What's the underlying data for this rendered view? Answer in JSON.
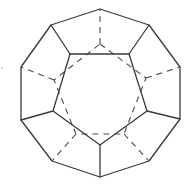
{
  "figure": {
    "view": "face-on along five-fold axis",
    "colors": {
      "line": "#3a3a3a",
      "hidden_line": "#4a4a4a",
      "background": "#ffffff"
    },
    "outer_decagon": [
      [
        100,
        9
      ],
      [
        149,
        25
      ],
      [
        180,
        67
      ],
      [
        180,
        119
      ],
      [
        149,
        161
      ],
      [
        100,
        177
      ],
      [
        52,
        161
      ],
      [
        21,
        120
      ],
      [
        21,
        67
      ],
      [
        51,
        25
      ]
    ],
    "front_pentagon": [
      [
        70,
        54
      ],
      [
        129,
        54
      ],
      [
        147,
        111
      ],
      [
        100,
        145
      ],
      [
        53,
        111
      ]
    ],
    "front_spokes": [
      [
        [
          70,
          54
        ],
        [
          51,
          25
        ]
      ],
      [
        [
          129,
          54
        ],
        [
          149,
          25
        ]
      ],
      [
        [
          147,
          111
        ],
        [
          180,
          119
        ]
      ],
      [
        [
          100,
          145
        ],
        [
          100,
          177
        ]
      ],
      [
        [
          53,
          111
        ],
        [
          21,
          120
        ]
      ]
    ],
    "hidden_pentagon": [
      [
        100,
        44
      ],
      [
        146,
        78
      ],
      [
        124,
        134
      ],
      [
        76,
        134
      ],
      [
        54,
        80
      ]
    ],
    "hidden_spokes": [
      [
        [
          100,
          44
        ],
        [
          100,
          9
        ]
      ],
      [
        [
          146,
          78
        ],
        [
          180,
          67
        ]
      ],
      [
        [
          124,
          134
        ],
        [
          149,
          161
        ]
      ],
      [
        [
          76,
          134
        ],
        [
          52,
          161
        ]
      ],
      [
        [
          54,
          80
        ],
        [
          21,
          67
        ]
      ]
    ],
    "stray_mark": [
      2,
      68
    ]
  }
}
